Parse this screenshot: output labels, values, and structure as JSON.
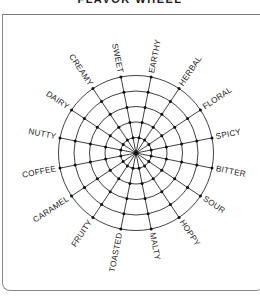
{
  "header": {
    "title": "FLAVOR WHEEL"
  },
  "wheel": {
    "center": [
      136,
      153
    ],
    "ring_radii": [
      15.5,
      31,
      46.5,
      62,
      77.5
    ],
    "spoke_offset_deg": 11.25,
    "line_color": "#2a2a2a",
    "node_color": "#111111",
    "flavors": [
      "SWEET",
      "EARTHY",
      "HERBAL",
      "FLORAL",
      "SPICY",
      "BITTER",
      "SOUR",
      "HOPPY",
      "MALTY",
      "TOASTED",
      "FRUITY",
      "CARAMEL",
      "COFFEE",
      "NUTTY",
      "DAIRY",
      "CREAMY"
    ]
  }
}
